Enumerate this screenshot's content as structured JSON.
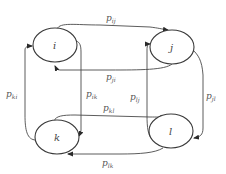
{
  "diagram": {
    "type": "state-transition",
    "nodes": [
      {
        "id": "i",
        "label": "i"
      },
      {
        "id": "j",
        "label": "j"
      },
      {
        "id": "k",
        "label": "k"
      },
      {
        "id": "l",
        "label": "l"
      }
    ],
    "edges": [
      {
        "from": "i",
        "to": "j",
        "label": "p",
        "sub": "ij"
      },
      {
        "from": "j",
        "to": "i",
        "label": "p",
        "sub": "ji"
      },
      {
        "from": "k",
        "to": "i",
        "label": "p",
        "sub": "ki"
      },
      {
        "from": "i",
        "to": "k",
        "label": "p",
        "sub": "ik"
      },
      {
        "from": "k",
        "to": "l",
        "label": "p",
        "sub": "kl"
      },
      {
        "from": "l",
        "to": "k",
        "label": "p",
        "sub": "lk"
      },
      {
        "from": "l",
        "to": "j",
        "label": "p",
        "sub": "lj"
      },
      {
        "from": "j",
        "to": "l",
        "label": "p",
        "sub": "jl"
      }
    ]
  }
}
